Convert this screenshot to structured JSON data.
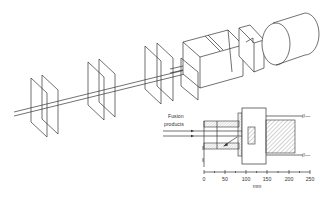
{
  "diagram": {
    "type": "technical-schematic",
    "inset": {
      "label_line1": "Fusion",
      "label_line2": "products",
      "scale": {
        "unit": "mm",
        "ticks": [
          "0",
          "50",
          "100",
          "150",
          "200",
          "250"
        ]
      }
    }
  },
  "colors": {
    "line": "#333333",
    "background": "#ffffff",
    "hatch": "#666666"
  }
}
